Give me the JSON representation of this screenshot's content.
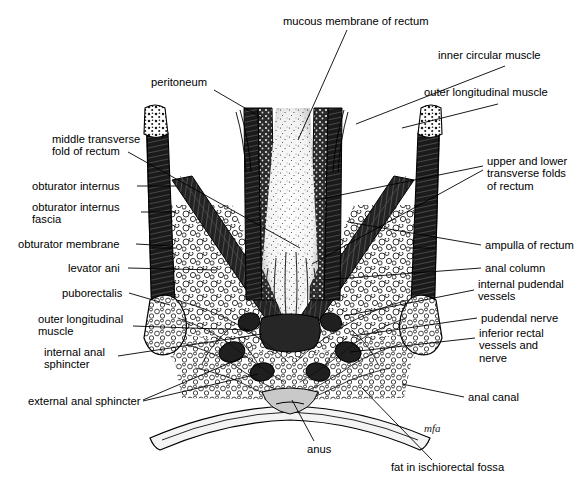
{
  "figure": {
    "type": "anatomical-illustration",
    "style": "black-and-white stipple and line engraving",
    "background_color": "#ffffff",
    "ink_color": "#000000",
    "artist_signature": "mfa"
  },
  "labels": {
    "top": [
      {
        "id": "mucous-membrane-of-rectum",
        "text": "mucous membrane of rectum",
        "x": 283,
        "y": 22,
        "align": "left"
      },
      {
        "id": "inner-circular-muscle",
        "text": "inner circular muscle",
        "x": 438,
        "y": 55,
        "align": "left"
      },
      {
        "id": "outer-longitudinal-muscle-top",
        "text": "outer longitudinal muscle",
        "x": 424,
        "y": 92,
        "align": "left"
      },
      {
        "id": "peritoneum",
        "text": "peritoneum",
        "x": 151,
        "y": 82,
        "align": "left"
      }
    ],
    "left": [
      {
        "id": "middle-transverse-fold-of-rectum",
        "text": "middle transverse\nfold of rectum",
        "x": 52,
        "y": 139,
        "align": "left"
      },
      {
        "id": "obturator-internus",
        "text": "obturator internus",
        "x": 32,
        "y": 182,
        "align": "left"
      },
      {
        "id": "obturator-internus-fascia",
        "text": "obturator internus\nfascia",
        "x": 32,
        "y": 207,
        "align": "left"
      },
      {
        "id": "obturator-membrane",
        "text": "obturator membrane",
        "x": 18,
        "y": 240,
        "align": "left"
      },
      {
        "id": "levator-ani",
        "text": "levator ani",
        "x": 68,
        "y": 264,
        "align": "left"
      },
      {
        "id": "puborectalis",
        "text": "puborectalis",
        "x": 62,
        "y": 289,
        "align": "left"
      },
      {
        "id": "outer-longitudinal-muscle-left",
        "text": "outer longitudinal\nmuscle",
        "x": 38,
        "y": 319,
        "align": "left"
      },
      {
        "id": "internal-anal-sphincter",
        "text": "internal anal\nsphincter",
        "x": 44,
        "y": 352,
        "align": "left"
      },
      {
        "id": "external-anal-sphincter",
        "text": "external anal sphincter",
        "x": 28,
        "y": 398,
        "align": "left"
      }
    ],
    "right": [
      {
        "id": "upper-and-lower-transverse-folds-of-rectum",
        "text": "upper and lower\ntransverse folds\nof rectum",
        "x": 487,
        "y": 161,
        "align": "left"
      },
      {
        "id": "ampulla-of-rectum",
        "text": "ampulla of rectum",
        "x": 485,
        "y": 241,
        "align": "left"
      },
      {
        "id": "anal-column",
        "text": "anal column",
        "x": 485,
        "y": 264,
        "align": "left"
      },
      {
        "id": "internal-pudendal-vessels",
        "text": "internal pudendal\nvessels",
        "x": 478,
        "y": 284,
        "align": "left"
      },
      {
        "id": "pudendal-nerve",
        "text": "pudendal nerve",
        "x": 481,
        "y": 314,
        "align": "left"
      },
      {
        "id": "inferior-rectal-vessels-and-nerve",
        "text": "inferior rectal\nvessels and\nnerve",
        "x": 479,
        "y": 333,
        "align": "left"
      },
      {
        "id": "anal-canal",
        "text": "anal canal",
        "x": 468,
        "y": 393,
        "align": "left"
      }
    ],
    "bottom": [
      {
        "id": "anus",
        "text": "anus",
        "x": 307,
        "y": 447,
        "align": "left"
      },
      {
        "id": "fat-in-ischiorectal-fossa",
        "text": "fat in ischiorectal fossa",
        "x": 391,
        "y": 466,
        "align": "left"
      }
    ]
  },
  "leader_lines": {
    "count": 22,
    "color": "#000000",
    "description": "thin straight pointer lines from each label to its anatomical structure"
  }
}
